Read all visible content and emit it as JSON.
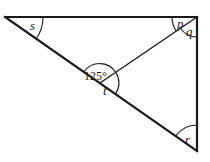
{
  "diagram": {
    "type": "geometry-triangle",
    "stroke_color": "#1a1a1a",
    "background": "#ffffff",
    "vertices": {
      "top_left": [
        5,
        17
      ],
      "top_right": [
        197,
        17
      ],
      "bottom_right": [
        197,
        151
      ],
      "hypotenuse_point": [
        100,
        83
      ]
    },
    "labels": {
      "s": "s",
      "p": "p",
      "q": "q",
      "angle_given": "125°",
      "t": "t",
      "r": "r"
    }
  }
}
